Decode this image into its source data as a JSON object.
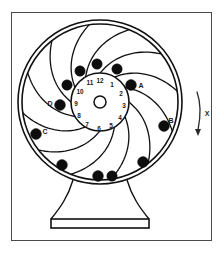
{
  "figure": {
    "frame": {
      "x": 11,
      "y": 12,
      "width": 200,
      "height": 228,
      "stroke": "#4a4a4a",
      "fill": "#ffffff"
    },
    "colors": {
      "outline": "#111111",
      "ball_fill": "#0d0d0d",
      "background": "#ffffff",
      "frame_stroke": "#555555",
      "text": "#1a1a1a"
    }
  },
  "wheel": {
    "center": {
      "x": 100,
      "y": 102
    },
    "outer_rim_radius_outer": 82,
    "outer_rim_radius_inner": 78,
    "hub_ring_radius": 29,
    "hub_bore_radius": 6,
    "spoke_count": 12,
    "spoke_curvature": 0.55
  },
  "clock_face": {
    "radius": 24,
    "numbers": [
      {
        "label": "12",
        "angle_deg": 0,
        "x": 100,
        "y": 81
      },
      {
        "label": "1",
        "angle_deg": 30,
        "x": 112,
        "y": 85
      },
      {
        "label": "2",
        "angle_deg": 60,
        "x": 121,
        "y": 94
      },
      {
        "label": "3",
        "angle_deg": 90,
        "x": 124,
        "y": 106
      },
      {
        "label": "4",
        "angle_deg": 120,
        "x": 120,
        "y": 118
      },
      {
        "label": "5",
        "angle_deg": 150,
        "x": 111,
        "y": 126
      },
      {
        "label": "6",
        "angle_deg": 180,
        "x": 99,
        "y": 129
      },
      {
        "label": "7",
        "angle_deg": 210,
        "x": 87,
        "y": 125
      },
      {
        "label": "8",
        "angle_deg": 240,
        "x": 79,
        "y": 116
      },
      {
        "label": "9",
        "angle_deg": 270,
        "x": 76,
        "y": 104
      },
      {
        "label": "10",
        "angle_deg": 300,
        "x": 80,
        "y": 92
      },
      {
        "label": "11",
        "angle_deg": 330,
        "x": 90,
        "y": 83
      }
    ]
  },
  "balls": [
    {
      "id": "ball-1",
      "label": "",
      "x": 97,
      "y": 64,
      "r": 5.2
    },
    {
      "id": "ball-2",
      "label": "",
      "x": 80,
      "y": 71,
      "r": 5.2
    },
    {
      "id": "ball-3",
      "label": "",
      "x": 67,
      "y": 85,
      "r": 5.2
    },
    {
      "id": "ball-4",
      "label": "D",
      "x": 60,
      "y": 105,
      "r": 5.4
    },
    {
      "id": "ball-5",
      "label": "C",
      "x": 36,
      "y": 134,
      "r": 5.4
    },
    {
      "id": "ball-6",
      "label": "",
      "x": 62,
      "y": 165,
      "r": 5.4
    },
    {
      "id": "ball-7",
      "label": "",
      "x": 98,
      "y": 176,
      "r": 5.4
    },
    {
      "id": "ball-8",
      "label": "",
      "x": 112,
      "y": 176,
      "r": 5.2
    },
    {
      "id": "ball-9",
      "label": "",
      "x": 143,
      "y": 162,
      "r": 5.4
    },
    {
      "id": "ball-10",
      "label": "B",
      "x": 164,
      "y": 126,
      "r": 5.4
    },
    {
      "id": "ball-11",
      "label": "A",
      "x": 131,
      "y": 85,
      "r": 5.4
    },
    {
      "id": "ball-12",
      "label": "",
      "x": 117,
      "y": 69,
      "r": 5.2
    }
  ],
  "ball_labels": [
    {
      "text": "A",
      "x": 141,
      "y": 86
    },
    {
      "text": "B",
      "x": 171,
      "y": 121
    },
    {
      "text": "C",
      "x": 45,
      "y": 132
    },
    {
      "text": "D",
      "x": 50,
      "y": 104
    }
  ],
  "stand": {
    "neck_left_x": 73,
    "neck_right_x": 127,
    "neck_top_y": 182,
    "foot_left_x": 51,
    "foot_right_x": 149,
    "foot_top_y": 219,
    "base_plate": {
      "x": 51,
      "y": 219,
      "width": 98,
      "height": 9
    }
  },
  "annotation": {
    "arrow": {
      "label": "X",
      "label_x": 207,
      "label_y": 114,
      "path": "M 197 92 C 201 103, 201 115, 198 130",
      "tip_x": 198,
      "tip_y": 132,
      "direction": "downward",
      "semantic": "rotation-direction-arrow"
    }
  }
}
